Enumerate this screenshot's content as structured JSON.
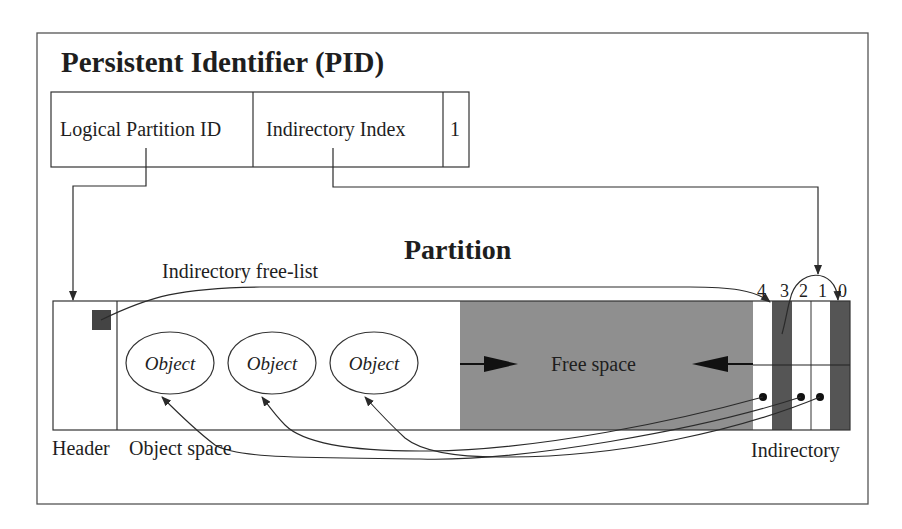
{
  "pid": {
    "title": "Persistent Identifier (PID)",
    "fields": [
      {
        "label": "Logical Partition ID"
      },
      {
        "label": "Indirectory Index"
      },
      {
        "label": "1"
      }
    ]
  },
  "partition": {
    "title": "Partition",
    "free_list_label": "Indirectory free-list",
    "free_space_label": "Free space",
    "objects": [
      {
        "label": "Object"
      },
      {
        "label": "Object"
      },
      {
        "label": "Object"
      }
    ],
    "slot_numbers": [
      "4",
      "3",
      "2",
      "1",
      "0"
    ],
    "region_labels": {
      "header": "Header",
      "object_space": "Object space",
      "indirectory": "Indirectory"
    }
  },
  "colors": {
    "free_space": "#8f8f8f",
    "used_slot": "#555555",
    "free_list_head": "#444444",
    "line": "#2a2a2a",
    "background": "#ffffff"
  }
}
